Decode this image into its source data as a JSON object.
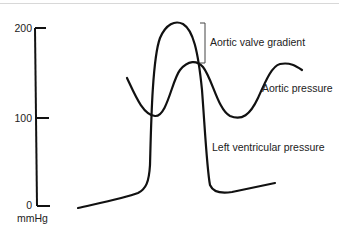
{
  "diagram": {
    "type": "pressure-waveform",
    "y_axis": {
      "unit_label": "mmHg",
      "ticks": [
        {
          "value": "200",
          "label": "200"
        },
        {
          "value": "100",
          "label": "100"
        },
        {
          "value": "0",
          "label": "0"
        }
      ],
      "range": [
        0,
        200
      ]
    },
    "curves": [
      {
        "name": "Left ventricular pressure",
        "label": "Left ventricular pressure",
        "color": "#111111"
      },
      {
        "name": "Aortic pressure",
        "label": "Aortic pressure",
        "color": "#111111"
      }
    ],
    "annotations": [
      {
        "type": "bracket",
        "label": "Aortic valve gradient"
      }
    ]
  }
}
